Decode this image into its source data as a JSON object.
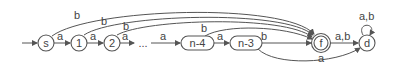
{
  "diagram": {
    "type": "finite-automaton",
    "colors": {
      "stroke": "#555555",
      "text": "#444444",
      "background": "#ffffff"
    },
    "states": {
      "s": "s",
      "q1": "1",
      "q2": "2",
      "ellipsis": "...",
      "n4": "n-4",
      "n3": "n-3",
      "f": "f",
      "d": "d"
    },
    "edges": {
      "s_q1": "a",
      "q1_q2": "a",
      "q2_ellipsis": "a",
      "ellipsis_n4": "a",
      "n4_n3": "a",
      "n3_f": "b",
      "f_d": "a,b",
      "d_d": "a,b",
      "n3_d": "a",
      "s_f": "b",
      "q1_f": "b",
      "q2_f": "b",
      "n4_f": "b"
    },
    "accepting_state": "f",
    "start_state": "s"
  }
}
